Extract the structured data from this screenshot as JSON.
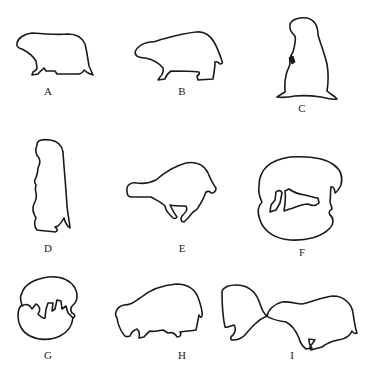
{
  "figure": {
    "stroke_color": "#1a1a1a",
    "background": "#ffffff",
    "panels": [
      {
        "id": "A",
        "label": "A",
        "pose": "walking on all fours, side view"
      },
      {
        "id": "B",
        "label": "B",
        "pose": "walking on all fours, side view"
      },
      {
        "id": "C",
        "label": "C",
        "pose": "sitting upright"
      },
      {
        "id": "D",
        "label": "D",
        "pose": "standing erect on hind legs"
      },
      {
        "id": "E",
        "label": "E",
        "pose": "running / leaping"
      },
      {
        "id": "F",
        "label": "F",
        "pose": "curled in ball"
      },
      {
        "id": "G",
        "label": "G",
        "pose": "curled, grooming"
      },
      {
        "id": "H",
        "label": "H",
        "pose": "crouched, head lowered"
      },
      {
        "id": "I",
        "label": "I",
        "pose": "two animals, nose-to-nose greeting"
      }
    ]
  }
}
